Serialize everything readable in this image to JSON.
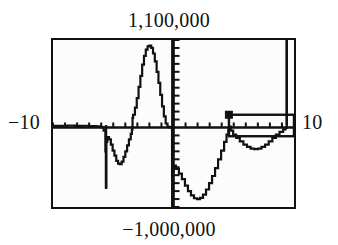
{
  "device": {
    "kind": "graphing-calculator-viewport",
    "screen": {
      "frame_color": "#111111",
      "background_color": "#fcfcfc",
      "trace_color": "#111111"
    }
  },
  "labels": {
    "y_max": "1,100,000",
    "y_min": "−1,000,000",
    "x_min": "−10",
    "x_max": "10"
  },
  "chart_data": {
    "type": "line",
    "title": "",
    "xlabel": "",
    "ylabel": "",
    "xlim": [
      -10,
      10
    ],
    "ylim": [
      -1000000,
      1100000
    ],
    "x_tick_labels": [
      "−10",
      "10"
    ],
    "y_tick_labels": [
      "−1,000,000",
      "1,100,000"
    ],
    "grid": false,
    "legend": null,
    "axes": {
      "x_axis_at_y": 0,
      "y_axis_at_x": 0,
      "x_tick_interval": 1,
      "y_tick_interval": 100000,
      "x_tick_count": 19,
      "y_tick_count": 20,
      "tick_side_x": "up",
      "tick_side_y": "right"
    },
    "annotations": [
      {
        "name": "cursor-marker",
        "shape": "filled-square",
        "x": 4.6,
        "y": 160000
      },
      {
        "name": "selection-box",
        "shape": "rectangle-outline",
        "x_range": [
          4.6,
          10.0
        ],
        "y_range": [
          -110000,
          160000
        ]
      },
      {
        "name": "left-vertical-asymptote",
        "shape": "vertical-line",
        "x": -5.6,
        "y_range": [
          -760000,
          30000
        ]
      },
      {
        "name": "center-vertical-asymptote",
        "shape": "vertical-line",
        "x": -0.1,
        "y_range": [
          -1000000,
          1100000
        ]
      },
      {
        "name": "right-vertical-asymptote",
        "shape": "vertical-line",
        "x": 9.4,
        "y_range": [
          30000,
          1100000
        ]
      }
    ],
    "series": [
      {
        "name": "y1",
        "style": "stepped-pixel-trace",
        "points": [
          [
            -10.0,
            20000
          ],
          [
            -9.4,
            20000
          ],
          [
            -8.8,
            25000
          ],
          [
            -8.2,
            20000
          ],
          [
            -7.6,
            22000
          ],
          [
            -7.0,
            18000
          ],
          [
            -6.4,
            15000
          ],
          [
            -6.0,
            5000
          ],
          [
            -5.8,
            -40000
          ],
          [
            -5.65,
            -300000
          ],
          [
            -5.6,
            -760000
          ],
          [
            -5.58,
            -180000
          ],
          [
            -5.5,
            -120000
          ],
          [
            -5.35,
            -150000
          ],
          [
            -5.2,
            -215000
          ],
          [
            -5.05,
            -290000
          ],
          [
            -4.9,
            -355000
          ],
          [
            -4.75,
            -420000
          ],
          [
            -4.6,
            -455000
          ],
          [
            -4.45,
            -460000
          ],
          [
            -4.3,
            -430000
          ],
          [
            -4.15,
            -370000
          ],
          [
            -4.0,
            -300000
          ],
          [
            -3.85,
            -225000
          ],
          [
            -3.7,
            -150000
          ],
          [
            -3.55,
            -80000
          ],
          [
            -3.45,
            -25000
          ],
          [
            -3.4,
            120000
          ],
          [
            -3.35,
            160000
          ],
          [
            -3.2,
            250000
          ],
          [
            -3.05,
            370000
          ],
          [
            -2.9,
            510000
          ],
          [
            -2.75,
            650000
          ],
          [
            -2.6,
            790000
          ],
          [
            -2.45,
            900000
          ],
          [
            -2.3,
            980000
          ],
          [
            -2.15,
            1020000
          ],
          [
            -2.0,
            1030000
          ],
          [
            -1.85,
            1000000
          ],
          [
            -1.7,
            930000
          ],
          [
            -1.55,
            830000
          ],
          [
            -1.4,
            700000
          ],
          [
            -1.25,
            560000
          ],
          [
            -1.1,
            410000
          ],
          [
            -0.95,
            265000
          ],
          [
            -0.8,
            140000
          ],
          [
            -0.65,
            50000
          ],
          [
            -0.5,
            10000
          ],
          [
            -0.4,
            5000
          ],
          [
            -0.3,
            2000
          ],
          [
            -0.2,
            0
          ],
          [
            -0.12,
            -620000
          ],
          [
            -0.1,
            -1000000
          ],
          [
            -0.06,
            -560000
          ],
          [
            0.0,
            -480000
          ],
          [
            0.2,
            -520000
          ],
          [
            0.45,
            -580000
          ],
          [
            0.7,
            -650000
          ],
          [
            0.95,
            -730000
          ],
          [
            1.2,
            -800000
          ],
          [
            1.45,
            -855000
          ],
          [
            1.7,
            -890000
          ],
          [
            1.95,
            -900000
          ],
          [
            2.2,
            -885000
          ],
          [
            2.45,
            -845000
          ],
          [
            2.7,
            -780000
          ],
          [
            2.95,
            -700000
          ],
          [
            3.2,
            -610000
          ],
          [
            3.45,
            -510000
          ],
          [
            3.7,
            -400000
          ],
          [
            3.95,
            -290000
          ],
          [
            4.2,
            -180000
          ],
          [
            4.4,
            -90000
          ],
          [
            4.55,
            -30000
          ],
          [
            4.62,
            10000
          ],
          [
            4.75,
            -40000
          ],
          [
            4.95,
            -90000
          ],
          [
            5.2,
            -130000
          ],
          [
            5.5,
            -175000
          ],
          [
            5.8,
            -215000
          ],
          [
            6.1,
            -245000
          ],
          [
            6.4,
            -265000
          ],
          [
            6.7,
            -272000
          ],
          [
            7.0,
            -265000
          ],
          [
            7.3,
            -245000
          ],
          [
            7.6,
            -215000
          ],
          [
            7.9,
            -175000
          ],
          [
            8.2,
            -130000
          ],
          [
            8.5,
            -90000
          ],
          [
            8.8,
            -55000
          ],
          [
            9.1,
            -25000
          ],
          [
            9.3,
            -5000
          ],
          [
            9.4,
            40000
          ],
          [
            9.4,
            1100000
          ]
        ]
      }
    ]
  }
}
